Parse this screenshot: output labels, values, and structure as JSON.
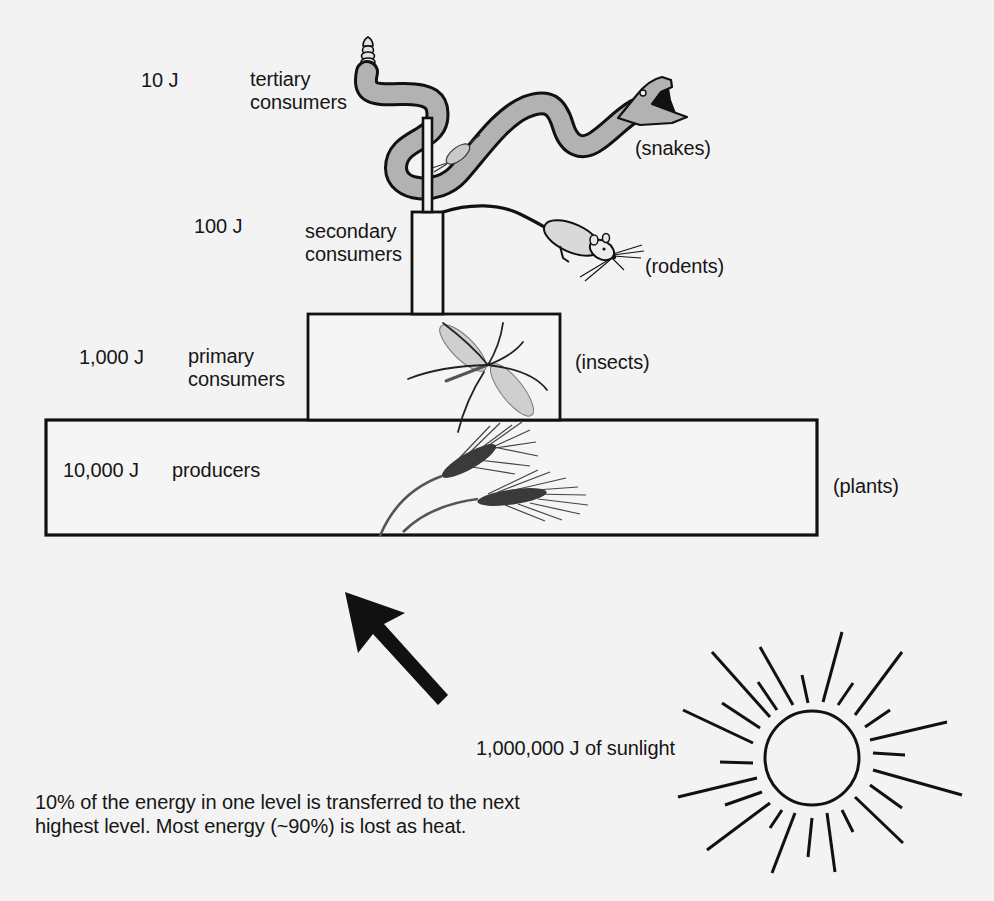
{
  "diagram": {
    "type": "energy-pyramid",
    "levels": [
      {
        "energy": "10 J",
        "name_line1": "tertiary",
        "name_line2": "consumers",
        "organism": "(snakes)",
        "icon": "snake-icon"
      },
      {
        "energy": "100 J",
        "name_line1": "secondary",
        "name_line2": "consumers",
        "organism": "(rodents)",
        "icon": "rodent-icon"
      },
      {
        "energy": "1,000 J",
        "name_line1": "primary",
        "name_line2": "consumers",
        "organism": "(insects)",
        "icon": "insect-icon"
      },
      {
        "energy": "10,000 J",
        "name_line1": "producers",
        "organism": "(plants)",
        "icon": "wheat-icon"
      }
    ],
    "sunlight": {
      "label": "1,000,000 J of sunlight",
      "icon": "sun-icon",
      "arrow_icon": "arrow-up-left-icon"
    },
    "note": {
      "line1": "10% of the energy in one level is transferred to the next",
      "line2": "highest level. Most energy (~90%) is lost as heat."
    }
  },
  "colors": {
    "background": "#f3f3f3",
    "ink": "#161616",
    "snake_body": "#b2b2b2",
    "rodent_body": "#d9d9d9",
    "insect_wing": "#cfcfcf",
    "wheat_head": "#3a3a3a"
  }
}
